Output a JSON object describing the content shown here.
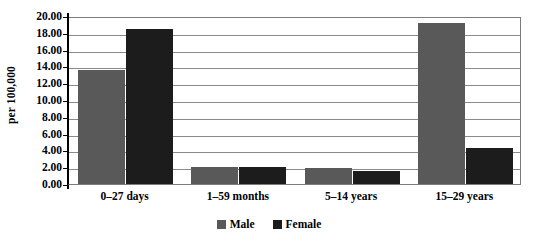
{
  "chart_data": {
    "type": "bar",
    "title": "",
    "xlabel": "",
    "ylabel": "per 100,000",
    "categories": [
      "0–27 days",
      "1–59 months",
      "5–14 years",
      "15–29 years"
    ],
    "series": [
      {
        "name": "Male",
        "color": "#595959",
        "values": [
          13.6,
          2.0,
          1.9,
          19.2
        ]
      },
      {
        "name": "Female",
        "color": "#1c1c1c",
        "values": [
          18.4,
          2.0,
          1.5,
          4.3
        ]
      }
    ],
    "ylim": [
      0,
      20
    ],
    "ytick_step": 2,
    "ytick_labels": [
      "0.00",
      "2.00",
      "4.00",
      "6.00",
      "8.00",
      "10.00",
      "12.00",
      "14.00",
      "16.00",
      "18.00",
      "20.00"
    ],
    "ytick_values": [
      0,
      2,
      4,
      6,
      8,
      10,
      12,
      14,
      16,
      18,
      20
    ],
    "grid": true,
    "grid_axis": "y",
    "legend_position": "bottom",
    "legend": [
      "Male",
      "Female"
    ],
    "annotations": []
  },
  "axis": {
    "y_title": "per 100,000"
  },
  "colors": {
    "male": "#595959",
    "female": "#1c1c1c",
    "gridline": "#8a8a8a",
    "axis": "#000000",
    "background": "#ffffff"
  }
}
